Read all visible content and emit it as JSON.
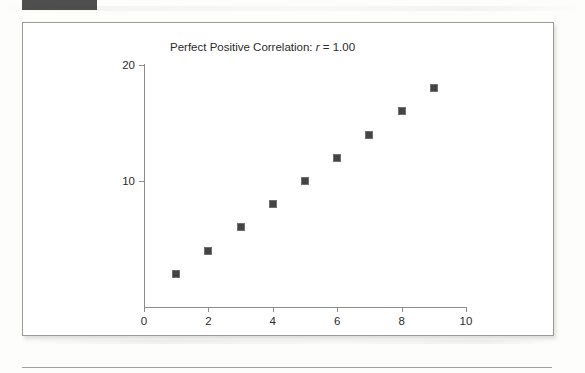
{
  "page": {
    "header_bar_color": "#4f4f4f",
    "figure_border_color": "#9a9a9a",
    "background_color": "#ffffff"
  },
  "chart_data": {
    "type": "scatter",
    "title": "Perfect Positive Correlation: r = 1.00",
    "title_prefix": "Perfect Positive Correlation: ",
    "title_r": "r",
    "title_suffix": " = 1.00",
    "correlation_r": "1.00",
    "xlabel": "",
    "ylabel": "",
    "xlim": [
      0,
      10
    ],
    "ylim": [
      0,
      20
    ],
    "xticks": [
      0,
      2,
      4,
      6,
      8,
      10
    ],
    "xtick_labels": [
      "0",
      "2",
      "4",
      "6",
      "8",
      "10"
    ],
    "yticks": [
      10,
      20
    ],
    "ytick_labels": [
      "10",
      "20"
    ],
    "grid": false,
    "legend": false,
    "marker": "square",
    "marker_color": "#444444",
    "x": [
      1,
      2,
      3,
      4,
      5,
      6,
      7,
      8,
      9
    ],
    "y": [
      2,
      4,
      6,
      8,
      10,
      12,
      14,
      16,
      18
    ],
    "points": [
      {
        "x": 1,
        "y": 2
      },
      {
        "x": 2,
        "y": 4
      },
      {
        "x": 3,
        "y": 6
      },
      {
        "x": 4,
        "y": 8
      },
      {
        "x": 5,
        "y": 10
      },
      {
        "x": 6,
        "y": 12
      },
      {
        "x": 7,
        "y": 14
      },
      {
        "x": 8,
        "y": 16
      },
      {
        "x": 9,
        "y": 18
      }
    ]
  }
}
